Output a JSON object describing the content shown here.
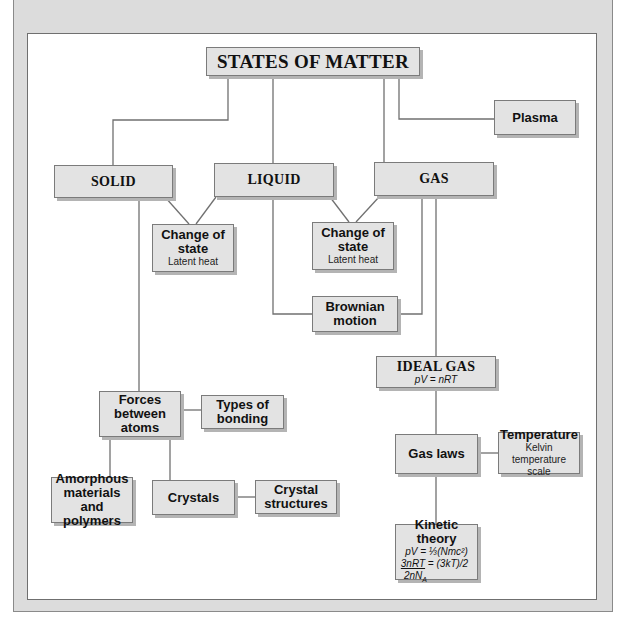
{
  "diagram": {
    "title": "STATES OF MATTER",
    "nodes": {
      "solid": {
        "label": "SOLID"
      },
      "liquid": {
        "label": "LIQUID"
      },
      "gas": {
        "label": "GAS"
      },
      "plasma": {
        "label": "Plasma"
      },
      "change_state_1": {
        "label_line1": "Change of",
        "label_line2": "state",
        "sub": "Latent heat"
      },
      "change_state_2": {
        "label_line1": "Change of",
        "label_line2": "state",
        "sub": "Latent heat"
      },
      "brownian": {
        "label_line1": "Brownian",
        "label_line2": "motion"
      },
      "ideal_gas": {
        "label": "IDEAL GAS",
        "formula": "pV = nRT"
      },
      "forces": {
        "label_line1": "Forces",
        "label_line2": "between",
        "label_line3": "atoms"
      },
      "bonding": {
        "label_line1": "Types of",
        "label_line2": "bonding"
      },
      "amorphous": {
        "label_line1": "Amorphous",
        "label_line2": "materials and",
        "label_line3": "polymers"
      },
      "crystals": {
        "label": "Crystals"
      },
      "crystal_structures": {
        "label_line1": "Crystal",
        "label_line2": "structures"
      },
      "gas_laws": {
        "label": "Gas laws"
      },
      "temperature": {
        "label": "Temperature",
        "sub_line1": "Kelvin temperature",
        "sub_line2": "scale"
      },
      "kinetic": {
        "label": "Kinetic theory",
        "f1": "pV = ⅓(Nmc²)",
        "f2_num": "3nRT",
        "f2_rest": " = (3kT)/2",
        "f3": "2nN",
        "f3_sub": "A"
      }
    },
    "colors": {
      "box_fill": "#e3e3e3",
      "box_border": "#7b7b7b",
      "line": "#707070",
      "frame": "#dcdcdc"
    }
  }
}
